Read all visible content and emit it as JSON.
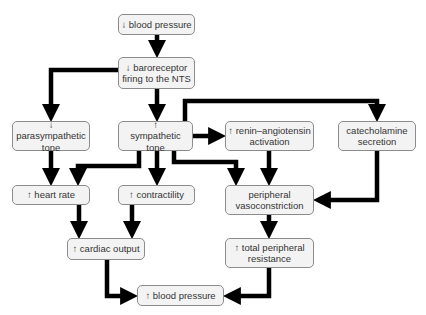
{
  "diagram": {
    "colors": {
      "node_fill": "#f3f3f3",
      "node_border": "#8c8c8c",
      "arrow": "#000000",
      "text": "#333333"
    },
    "nodes": {
      "bp_down": {
        "label": "↓ blood pressure"
      },
      "baroreceptor": {
        "label": "↓ baroreceptor firing to the NTS"
      },
      "parasympathetic": {
        "label": "↓ parasympathetic tone"
      },
      "sympathetic": {
        "label": "↑ sympathetic tone"
      },
      "renin": {
        "label": "↑ renin–angiotensin activation"
      },
      "catecholamine": {
        "label": "catecholamine secretion"
      },
      "heart_rate": {
        "label": "↑ heart rate"
      },
      "contractility": {
        "label": "↑ contractility"
      },
      "vasoconstriction": {
        "label": "peripheral vasoconstriction"
      },
      "cardiac_output": {
        "label": "↑ cardiac output"
      },
      "tpr": {
        "label": "↑ total peripheral resistance"
      },
      "bp_up": {
        "label": "↑ blood pressure"
      }
    },
    "edges": [
      [
        "bp_down",
        "baroreceptor"
      ],
      [
        "baroreceptor",
        "parasympathetic"
      ],
      [
        "baroreceptor",
        "sympathetic"
      ],
      [
        "sympathetic",
        "renin"
      ],
      [
        "sympathetic",
        "catecholamine"
      ],
      [
        "parasympathetic",
        "heart_rate"
      ],
      [
        "sympathetic",
        "heart_rate"
      ],
      [
        "sympathetic",
        "contractility"
      ],
      [
        "sympathetic",
        "vasoconstriction"
      ],
      [
        "renin",
        "vasoconstriction"
      ],
      [
        "catecholamine",
        "vasoconstriction"
      ],
      [
        "heart_rate",
        "cardiac_output"
      ],
      [
        "contractility",
        "cardiac_output"
      ],
      [
        "vasoconstriction",
        "tpr"
      ],
      [
        "cardiac_output",
        "bp_up"
      ],
      [
        "tpr",
        "bp_up"
      ]
    ]
  }
}
